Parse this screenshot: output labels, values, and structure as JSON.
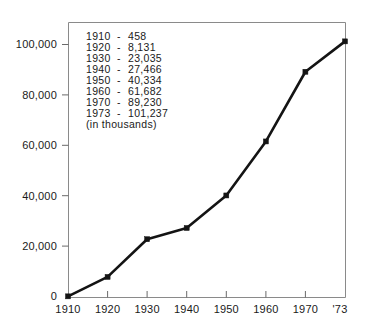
{
  "chart_data": {
    "type": "line",
    "title": "",
    "subtitle": "",
    "xlabel": "",
    "ylabel": "",
    "units_note": "(in thousands)",
    "categories": [
      "1910",
      "1920",
      "1930",
      "1940",
      "1950",
      "1960",
      "1970",
      "1973"
    ],
    "x_tick_labels": [
      "1910",
      "1920",
      "1930",
      "1940",
      "1950",
      "1960",
      "1970",
      "'73"
    ],
    "values": [
      458,
      8131,
      23035,
      27466,
      40334,
      61682,
      89230,
      101237
    ],
    "y_tick_labels": [
      "0",
      "20,000",
      "40,000",
      "60,000",
      "80,000",
      "100,000"
    ],
    "y_tick_values": [
      0,
      20000,
      40000,
      60000,
      80000,
      100000
    ],
    "ylim": [
      0,
      105000
    ],
    "grid": false,
    "legend": false,
    "legend_position": "none",
    "marker": "square",
    "line_color": "#141414",
    "frame_color": "#8a8a8a",
    "background_color": "#ffffff"
  },
  "annotation_table": {
    "rows": [
      {
        "year": "1910",
        "dash": "-",
        "value": "458"
      },
      {
        "year": "1920",
        "dash": "-",
        "value": "8,131"
      },
      {
        "year": "1930",
        "dash": "-",
        "value": "23,035"
      },
      {
        "year": "1940",
        "dash": "-",
        "value": "27,466"
      },
      {
        "year": "1950",
        "dash": "-",
        "value": "40,334"
      },
      {
        "year": "1960",
        "dash": "-",
        "value": "61,682"
      },
      {
        "year": "1970",
        "dash": "-",
        "value": "89,230"
      },
      {
        "year": "1973",
        "dash": "-",
        "value": "101,237"
      }
    ],
    "note": "(in thousands)"
  }
}
